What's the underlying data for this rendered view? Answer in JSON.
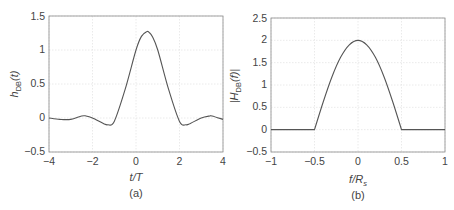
{
  "chart_data": [
    {
      "type": "line",
      "panel_label": "(a)",
      "title": "",
      "xlabel": "t/T",
      "ylabel": "h_DB(t)",
      "xlim": [
        -4,
        4
      ],
      "ylim": [
        -0.5,
        1.5
      ],
      "xticks": [
        "-4",
        "-2",
        "0",
        "2",
        "4"
      ],
      "yticks": [
        "-0.5",
        "0",
        "0.5",
        "1",
        "1.5"
      ],
      "grid": true,
      "series": [
        {
          "name": "h_DB(t)",
          "x": [
            -4,
            -3.5,
            -3,
            -2.5,
            -2.3,
            -2,
            -1.5,
            -1.3,
            -1,
            -0.5,
            0,
            0.25,
            0.5,
            0.6,
            0.75,
            1,
            1.5,
            2,
            2.3,
            2.5,
            3,
            3.4,
            3.5,
            4
          ],
          "y": [
            0.0,
            -0.02,
            -0.02,
            0.03,
            0.03,
            0.0,
            -0.08,
            -0.1,
            -0.05,
            0.42,
            1.0,
            1.2,
            1.27,
            1.26,
            1.2,
            1.0,
            0.42,
            -0.05,
            -0.1,
            -0.08,
            0.0,
            0.03,
            0.03,
            -0.02
          ]
        }
      ]
    },
    {
      "type": "line",
      "panel_label": "(b)",
      "title": "",
      "xlabel": "f/R_s",
      "ylabel": "|H_DB(f)|",
      "xlim": [
        -1,
        1
      ],
      "ylim": [
        -0.5,
        2.5
      ],
      "xticks": [
        "-1",
        "-0.5",
        "0",
        "0.5",
        "1"
      ],
      "yticks": [
        "-0.5",
        "0",
        "0.5",
        "1",
        "1.5",
        "2",
        "2.5"
      ],
      "grid": true,
      "series": [
        {
          "name": "|H_DB(f)|",
          "x": [
            -1,
            -0.5,
            -0.4,
            -0.3,
            -0.2,
            -0.1,
            0,
            0.1,
            0.2,
            0.3,
            0.4,
            0.5,
            1
          ],
          "y": [
            0,
            0,
            0.62,
            1.18,
            1.62,
            1.9,
            2.0,
            1.9,
            1.62,
            1.18,
            0.62,
            0,
            0
          ]
        }
      ]
    }
  ],
  "panels": {
    "a": {
      "caption": "(a)",
      "xlabel": "t/T",
      "ylabel_main": "h",
      "ylabel_sub": "DB",
      "ylabel_arg": "(t)",
      "xticks": [
        "−4",
        "−2",
        "0",
        "2",
        "4"
      ],
      "yticks": [
        "−0.5",
        "0",
        "0.5",
        "1",
        "1.5"
      ]
    },
    "b": {
      "caption": "(b)",
      "xlabel_main": "f/R",
      "xlabel_sub": "s",
      "ylabel_main": "|H",
      "ylabel_sub": "DB",
      "ylabel_arg": "(f)|",
      "xticks": [
        "−1",
        "−0.5",
        "0",
        "0.5",
        "1"
      ],
      "yticks": [
        "−0.5",
        "0",
        "0.5",
        "1",
        "1.5",
        "2",
        "2.5"
      ]
    }
  },
  "colors": {
    "curve": "#555555",
    "grid": "#e4e4e4",
    "axis": "#8a8a8a"
  }
}
